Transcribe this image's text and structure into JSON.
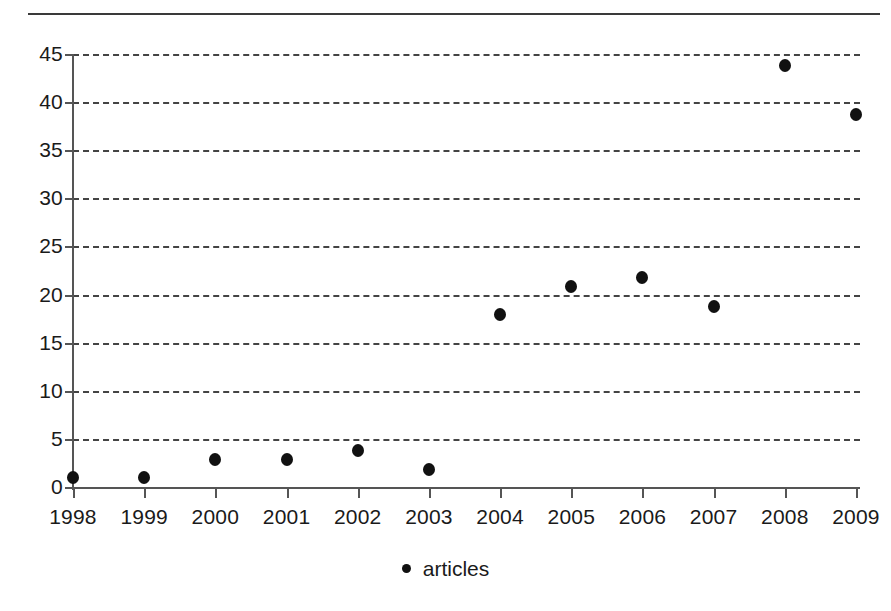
{
  "chart_data": {
    "type": "scatter",
    "title": "",
    "subtitle": "",
    "xlabel": "",
    "ylabel": "",
    "categories": [
      "1998",
      "1999",
      "2000",
      "2001",
      "2002",
      "2003",
      "2004",
      "2005",
      "2006",
      "2007",
      "2008",
      "2009"
    ],
    "x": [
      1998,
      1999,
      2000,
      2001,
      2002,
      2003,
      2004,
      2005,
      2006,
      2007,
      2008,
      2009
    ],
    "series": [
      {
        "name": "articles",
        "marker": "filled-circle",
        "color": "#111111",
        "values": [
          1.0,
          1.0,
          2.9,
          2.9,
          3.8,
          1.8,
          17.9,
          20.8,
          21.8,
          18.8,
          43.8,
          38.7
        ]
      }
    ],
    "ylim": [
      0,
      45
    ],
    "ytick_labels": [
      "0",
      "5",
      "10",
      "15",
      "20",
      "25",
      "30",
      "35",
      "40",
      "45"
    ],
    "yticks": [
      0,
      5,
      10,
      15,
      20,
      25,
      30,
      35,
      40,
      45
    ],
    "xtick_labels": [
      "1998",
      "1999",
      "2000",
      "2001",
      "2002",
      "2003",
      "2004",
      "2005",
      "2006",
      "2007",
      "2008",
      "2009"
    ],
    "grid": "horizontal-dashed",
    "gridline_color": "#444444",
    "axis_color": "#555555",
    "background_color": "#ffffff",
    "legend": {
      "position": "bottom-center",
      "entries": [
        {
          "label": "articles",
          "marker": "filled-circle",
          "color": "#111111"
        }
      ]
    },
    "annotations": []
  },
  "figure": {
    "top_rule_color": "#3a3a3a"
  }
}
